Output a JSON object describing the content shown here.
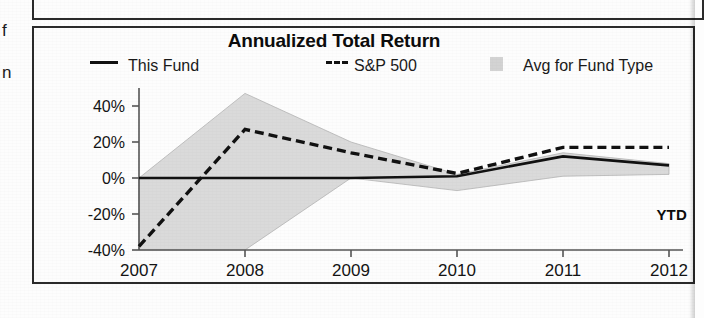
{
  "margin_glyphs": {
    "top": "f",
    "bottom": "n"
  },
  "chart_title": "Annualized Total Return",
  "legend": {
    "this_fund": {
      "label": "This Fund",
      "marker": "solid-line-marker",
      "color": "#111111"
    },
    "sp500": {
      "label": "S&P 500",
      "marker": "dashed-line-marker",
      "prefix": "---",
      "color": "#111111"
    },
    "avg_fund_type": {
      "label": "Avg for Fund Type",
      "marker": "gray-swatch-marker",
      "color": "#d3d3d3"
    }
  },
  "axis": {
    "y_ticks": [
      "40%",
      "20%",
      "0%",
      "-20%",
      "-40%"
    ],
    "x_ticks": [
      "2007",
      "2008",
      "2009",
      "2010",
      "2011",
      "2012"
    ],
    "ytd_label": "YTD"
  },
  "chart_data": {
    "type": "line",
    "title": "Annualized Total Return",
    "xlabel": "",
    "ylabel": "",
    "x": [
      "2007",
      "2008",
      "2009",
      "2010",
      "2011",
      "2012"
    ],
    "ylim": [
      -40,
      50
    ],
    "y_tick_values": [
      40,
      20,
      0,
      -20,
      -40
    ],
    "y_tick_labels": [
      "40%",
      "20%",
      "0%",
      "-20%",
      "-40%"
    ],
    "grid": false,
    "legend_position": "top",
    "zero_line": 0,
    "series": [
      {
        "name": "This Fund",
        "style": "solid",
        "color": "#111111",
        "values": [
          0,
          0,
          0,
          1,
          12,
          7
        ]
      },
      {
        "name": "S&P 500",
        "style": "dashed",
        "color": "#111111",
        "values": [
          -38,
          27,
          14,
          2.5,
          17,
          17
        ]
      }
    ],
    "band": {
      "name": "Avg for Fund Type",
      "style": "shaded-area",
      "color": "#d3d3d3",
      "upper": [
        0,
        47,
        20,
        2,
        14,
        8
      ],
      "lower": [
        -40,
        -40,
        0,
        -7,
        1,
        2
      ]
    }
  }
}
